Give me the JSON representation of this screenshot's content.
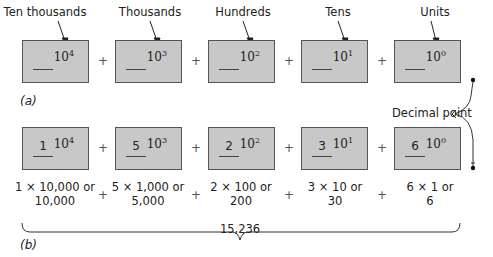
{
  "part_a": {
    "caption": "(a)",
    "headers": [
      "Ten thousands",
      "Thousands",
      "Hundreds",
      "Tens",
      "Units"
    ],
    "powers": [
      {
        "base": "10",
        "exp": "4"
      },
      {
        "base": "10",
        "exp": "3"
      },
      {
        "base": "10",
        "exp": "2"
      },
      {
        "base": "10",
        "exp": "1"
      },
      {
        "base": "10",
        "exp": "0"
      }
    ],
    "operator": "+"
  },
  "part_b": {
    "caption": "(b)",
    "digits": [
      "1",
      "5",
      "2",
      "3",
      "6"
    ],
    "powers": [
      {
        "base": "10",
        "exp": "4"
      },
      {
        "base": "10",
        "exp": "3"
      },
      {
        "base": "10",
        "exp": "2"
      },
      {
        "base": "10",
        "exp": "1"
      },
      {
        "base": "10",
        "exp": "0"
      }
    ],
    "expansions": [
      {
        "line1": "1 × 10,000 or",
        "line2": "10,000"
      },
      {
        "line1": "5 × 1,000 or",
        "line2": "5,000"
      },
      {
        "line1": "2 × 100 or",
        "line2": "200"
      },
      {
        "line1": "3 × 10 or",
        "line2": "30"
      },
      {
        "line1": "6 × 1 or",
        "line2": "6"
      }
    ],
    "operator": "+",
    "total": "15,236"
  },
  "decimal_point_label": "Decimal point"
}
